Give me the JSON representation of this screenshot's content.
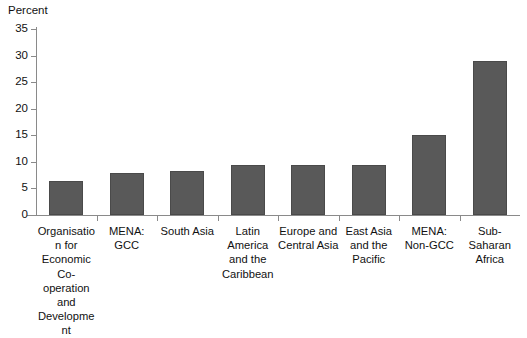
{
  "axis": {
    "y_caption": "Percent",
    "y_ticks": [
      "0",
      "5",
      "10",
      "15",
      "20",
      "25",
      "30",
      "35"
    ]
  },
  "chart_data": {
    "type": "bar",
    "title": "",
    "subtitle": "",
    "xlabel": "",
    "ylabel": "Percent",
    "ylim": [
      0,
      35
    ],
    "ytick_step": 5,
    "grid": false,
    "legend": "none",
    "bar_color": "#595959",
    "bar_edge_color": "#4a4a4a",
    "axis_color": "#8a8a8a",
    "categories": [
      "Organisation for Economic Co-operation and Development",
      "MENA: GCC",
      "South Asia",
      "Latin America and the Caribbean",
      "Europe and Central Asia",
      "East Asia and the Pacific",
      "MENA: Non-GCC",
      "Sub-Saharan Africa"
    ],
    "values": [
      6.4,
      8.0,
      8.2,
      9.5,
      9.5,
      9.5,
      15.1,
      29.0
    ]
  }
}
